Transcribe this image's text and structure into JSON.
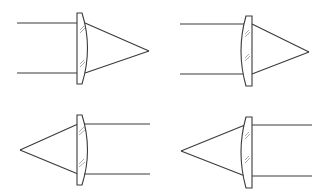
{
  "diagram": {
    "line_color": "#3a3a3a",
    "hatch_color": "#8a8a8a",
    "panels": [
      {
        "id": "top-left",
        "rays_from": "left",
        "curved_side": "right",
        "focal_point": [
          149,
          51
        ]
      },
      {
        "id": "top-right",
        "rays_from": "left",
        "curved_side": "left",
        "focal_point": [
          309,
          52
        ]
      },
      {
        "id": "bottom-left",
        "rays_from": "right",
        "curved_side": "right",
        "focal_point": [
          20,
          150
        ]
      },
      {
        "id": "bottom-right",
        "rays_from": "right",
        "curved_side": "left",
        "focal_point": [
          181,
          151
        ]
      }
    ]
  }
}
